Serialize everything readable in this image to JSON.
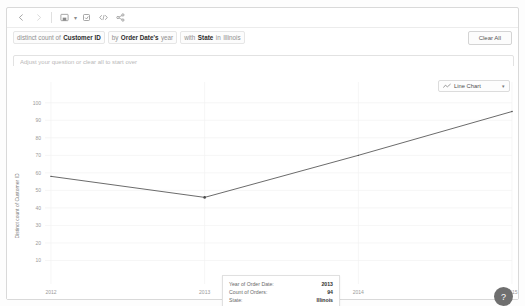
{
  "toolbar": {
    "items": [
      {
        "name": "back-button",
        "glyph": "←",
        "state": "enabled"
      },
      {
        "name": "forward-button",
        "glyph": "→",
        "state": "disabled"
      },
      {
        "name": "save-button",
        "glyph": "save",
        "state": "enabled"
      },
      {
        "name": "revert-button",
        "glyph": "revert",
        "state": "enabled"
      },
      {
        "name": "embed-code-button",
        "glyph": "</>",
        "state": "enabled"
      },
      {
        "name": "share-button",
        "glyph": "share",
        "state": "enabled"
      }
    ],
    "save_caret": "▾"
  },
  "question": {
    "prefix": "distinct count of",
    "measure": "Customer ID",
    "by_label": "by",
    "dimension": "Order Date's",
    "dimension_suffix": "year",
    "with_label": "with",
    "filter_field": "State",
    "filter_prefix": "in",
    "filter_value": "Illinois",
    "clear_all_label": "Clear All"
  },
  "input": {
    "value": "",
    "placeholder": "Adjust your question or clear all to start over"
  },
  "chart_controls": {
    "type_icon": "line-chart-icon",
    "selected_type": "Line Chart",
    "caret": "▾"
  },
  "tooltip": {
    "rows": [
      {
        "key": "Year of Order Date:",
        "value": "2013"
      },
      {
        "key": "Count of Orders:",
        "value": "94"
      },
      {
        "key": "State:",
        "value": "Illinois"
      },
      {
        "key": "Distinct count of Customer ID:",
        "value": "46"
      }
    ]
  },
  "corner_badge": {
    "glyph": "?"
  },
  "colors": {
    "line": "#5a5a5a",
    "grid": "#f0f0f0",
    "axis_text": "#9a9a9a",
    "panel_border": "#d9d9d9"
  },
  "chart_data": {
    "type": "line",
    "title": "",
    "xlabel": "Year of Order Date",
    "ylabel": "Distinct count of Customer ID",
    "x": [
      "2012",
      "2013",
      "2014",
      "2015"
    ],
    "values": [
      58,
      46,
      70,
      95
    ],
    "categories": [
      "2012",
      "2013",
      "2014",
      "2015"
    ],
    "series": [
      {
        "name": "Distinct count of Customer ID",
        "values": [
          58,
          46,
          70,
          95
        ]
      }
    ],
    "xtick_labels": [
      "2012",
      "2013",
      "2014",
      "2015"
    ],
    "ytick_labels": [
      "10",
      "20",
      "30",
      "40",
      "50",
      "60",
      "70",
      "80",
      "90",
      "100"
    ],
    "ylim": [
      0,
      105
    ],
    "grid": true,
    "legend": false,
    "highlighted_point": {
      "x": "2013",
      "y": 46
    }
  }
}
